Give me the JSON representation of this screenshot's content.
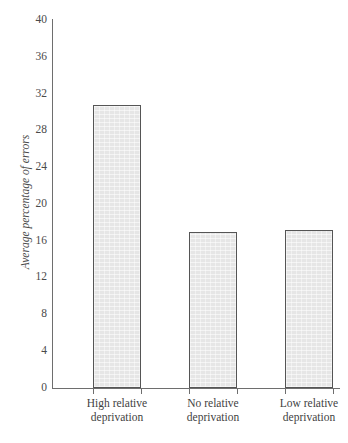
{
  "chart_data": {
    "type": "bar",
    "title": "",
    "subtitle": "",
    "xlabel": "",
    "ylabel": "Average percentage of errors",
    "categories": [
      "High relative deprivation",
      "No relative deprivation",
      "Low relative deprivation"
    ],
    "category_lines": [
      [
        "High relative",
        "deprivation"
      ],
      [
        "No relative",
        "deprivation"
      ],
      [
        "Low relative",
        "deprivation"
      ]
    ],
    "values": [
      30.8,
      17.0,
      17.2
    ],
    "ylim": [
      0,
      40
    ],
    "ytick_labels": [
      "0",
      "4",
      "8",
      "12",
      "16",
      "20",
      "24",
      "28",
      "32",
      "36",
      "40"
    ],
    "ytick_values": [
      0,
      4,
      8,
      12,
      16,
      20,
      24,
      28,
      32,
      36,
      40
    ],
    "grid": false,
    "legend": false,
    "legend_position": "none",
    "bar_fill_color": "#e6e6e6",
    "bar_border_color": "#555555",
    "axis_color": "#6e6e6e",
    "text_color": "#3f3f3f",
    "background_color": "#ffffff"
  },
  "artifacts": {
    "top_mark": "",
    "bottom_caption": ""
  }
}
